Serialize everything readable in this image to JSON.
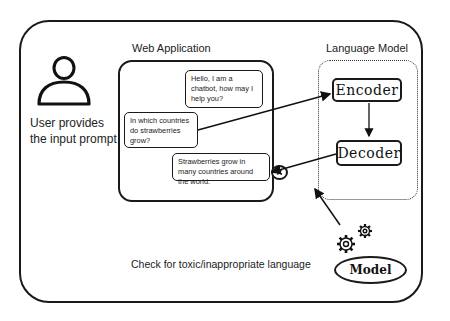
{
  "diagram": {
    "user": {
      "icon": "person-icon",
      "label": "User provides the input prompt"
    },
    "web_app": {
      "title": "Web Application",
      "bubbles": [
        {
          "id": "greeting",
          "text": "Hello, I am a chatbot, how may I help you?"
        },
        {
          "id": "question",
          "text": "In which countries do strawberries grow?"
        },
        {
          "id": "answer",
          "text": "Strawberries grow in many countries around the world."
        }
      ]
    },
    "language_model": {
      "title": "Language Model",
      "encoder": "Encoder",
      "decoder": "Decoder"
    },
    "filter": {
      "icon": "x-circle-icon",
      "symbol": "×",
      "gears_icon": "gears-icon",
      "model_label": "Model",
      "caption": "Check for toxic/inappropriate language"
    },
    "colors": {
      "stroke": "#1a1a1a",
      "background": "#ffffff",
      "text": "#222222"
    }
  }
}
